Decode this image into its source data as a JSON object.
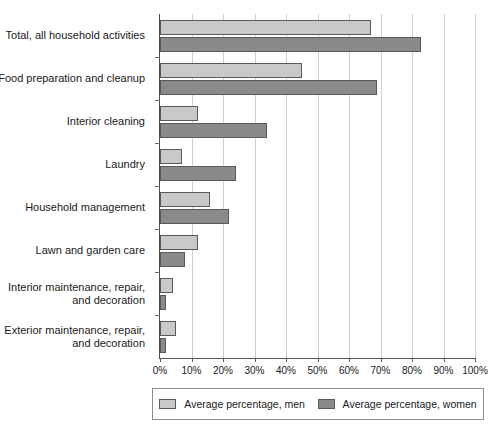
{
  "chart_data": {
    "type": "bar",
    "orientation": "horizontal",
    "title": "",
    "xlabel": "",
    "ylabel": "",
    "xlim": [
      0,
      100
    ],
    "grid": true,
    "legend_position": "bottom",
    "tick_labels": [
      "0%",
      "10%",
      "20%",
      "30%",
      "40%",
      "50%",
      "60%",
      "70%",
      "80%",
      "90%",
      "100%"
    ],
    "tick_values": [
      0,
      10,
      20,
      30,
      40,
      50,
      60,
      70,
      80,
      90,
      100
    ],
    "categories": [
      "Total, all household activities",
      "Food preparation and cleanup",
      "Interior cleaning",
      "Laundry",
      "Household management",
      "Lawn and garden care",
      "Interior maintenance, repair,\nand decoration",
      "Exterior maintenance, repair,\nand decoration"
    ],
    "series": [
      {
        "name": "Average percentage, men",
        "color": "#c9c9c9",
        "values": [
          67,
          45,
          12,
          7,
          16,
          12,
          4,
          5
        ]
      },
      {
        "name": "Average percentage, women",
        "color": "#8a8a8a",
        "values": [
          83,
          69,
          34,
          24,
          22,
          8,
          2,
          2
        ]
      }
    ]
  },
  "legend": {
    "items": [
      {
        "label": "Average percentage, men",
        "swatch": "men"
      },
      {
        "label": "Average percentage, women",
        "swatch": "women"
      }
    ]
  }
}
